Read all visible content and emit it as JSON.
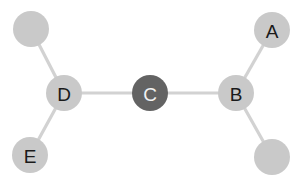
{
  "figure": {
    "type": "node-link-diagram",
    "background_color": "#ffffff",
    "width": 300,
    "height": 183
  },
  "style": {
    "node_fill": "#c9c9c9",
    "node_fill_highlight": "#636363",
    "node_label_color": "#1a1a1a",
    "node_label_color_highlight": "#f2f2f2",
    "edge_color": "#d2d2d2",
    "edge_width": 3.2,
    "node_radius": 18
  },
  "nodes": [
    {
      "id": "n1",
      "label": "",
      "cx": 31,
      "cy": 29,
      "r": 18,
      "fill": "#c9c9c9",
      "label_color": "#1a1a1a"
    },
    {
      "id": "D",
      "label": "D",
      "cx": 64,
      "cy": 93,
      "r": 18,
      "fill": "#c9c9c9",
      "label_color": "#1a1a1a"
    },
    {
      "id": "E",
      "label": "E",
      "cx": 30,
      "cy": 155,
      "r": 18,
      "fill": "#c9c9c9",
      "label_color": "#1a1a1a"
    },
    {
      "id": "C",
      "label": "C",
      "cx": 150,
      "cy": 93,
      "r": 18,
      "fill": "#636363",
      "label_color": "#f2f2f2"
    },
    {
      "id": "B",
      "label": "B",
      "cx": 236,
      "cy": 93,
      "r": 18,
      "fill": "#c9c9c9",
      "label_color": "#1a1a1a"
    },
    {
      "id": "A",
      "label": "A",
      "cx": 272,
      "cy": 30,
      "r": 18,
      "fill": "#c9c9c9",
      "label_color": "#1a1a1a"
    },
    {
      "id": "n2",
      "label": "",
      "cx": 272,
      "cy": 157,
      "r": 18,
      "fill": "#c9c9c9",
      "label_color": "#1a1a1a"
    }
  ],
  "edges": [
    {
      "id": "e1",
      "source": "n1",
      "target": "D",
      "x1": 31,
      "y1": 29,
      "x2": 64,
      "y2": 93
    },
    {
      "id": "e2",
      "source": "D",
      "target": "E",
      "x1": 64,
      "y1": 93,
      "x2": 30,
      "y2": 155
    },
    {
      "id": "e3",
      "source": "D",
      "target": "C",
      "x1": 64,
      "y1": 93,
      "x2": 150,
      "y2": 93
    },
    {
      "id": "e4",
      "source": "C",
      "target": "B",
      "x1": 150,
      "y1": 93,
      "x2": 236,
      "y2": 93
    },
    {
      "id": "e5",
      "source": "B",
      "target": "A",
      "x1": 236,
      "y1": 93,
      "x2": 272,
      "y2": 30
    },
    {
      "id": "e6",
      "source": "B",
      "target": "n2",
      "x1": 236,
      "y1": 93,
      "x2": 272,
      "y2": 157
    }
  ]
}
